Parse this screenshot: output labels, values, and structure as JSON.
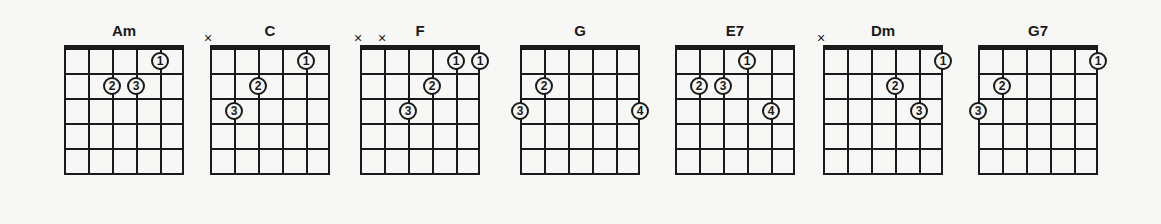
{
  "chords": [
    {
      "name": "Am",
      "x": 64,
      "muted": [],
      "dots": [
        {
          "s": 4,
          "f": 1,
          "n": "1"
        },
        {
          "s": 2,
          "f": 2,
          "n": "2"
        },
        {
          "s": 3,
          "f": 2,
          "n": "3"
        }
      ]
    },
    {
      "name": "C",
      "x": 210,
      "muted": [
        0
      ],
      "dots": [
        {
          "s": 4,
          "f": 1,
          "n": "1"
        },
        {
          "s": 2,
          "f": 2,
          "n": "2"
        },
        {
          "s": 1,
          "f": 3,
          "n": "3"
        }
      ]
    },
    {
      "name": "F",
      "x": 360,
      "muted": [
        0,
        1
      ],
      "dots": [
        {
          "s": 4,
          "f": 1,
          "n": "1"
        },
        {
          "s": 5,
          "f": 1,
          "n": "1"
        },
        {
          "s": 3,
          "f": 2,
          "n": "2"
        },
        {
          "s": 2,
          "f": 3,
          "n": "3"
        }
      ]
    },
    {
      "name": "G",
      "x": 520,
      "muted": [],
      "dots": [
        {
          "s": 1,
          "f": 2,
          "n": "2"
        },
        {
          "s": 0,
          "f": 3,
          "n": "3"
        },
        {
          "s": 5,
          "f": 3,
          "n": "4"
        }
      ]
    },
    {
      "name": "E7",
      "x": 675,
      "muted": [],
      "dots": [
        {
          "s": 3,
          "f": 1,
          "n": "1"
        },
        {
          "s": 1,
          "f": 2,
          "n": "2"
        },
        {
          "s": 2,
          "f": 2,
          "n": "3"
        },
        {
          "s": 4,
          "f": 3,
          "n": "4"
        }
      ]
    },
    {
      "name": "Dm",
      "x": 823,
      "muted": [
        0
      ],
      "dots": [
        {
          "s": 5,
          "f": 1,
          "n": "1"
        },
        {
          "s": 3,
          "f": 2,
          "n": "2"
        },
        {
          "s": 4,
          "f": 3,
          "n": "3"
        }
      ]
    },
    {
      "name": "G7",
      "x": 978,
      "muted": [],
      "dots": [
        {
          "s": 5,
          "f": 1,
          "n": "1"
        },
        {
          "s": 1,
          "f": 2,
          "n": "2"
        },
        {
          "s": 0,
          "f": 3,
          "n": "3"
        }
      ]
    }
  ],
  "mute_symbol": "×"
}
